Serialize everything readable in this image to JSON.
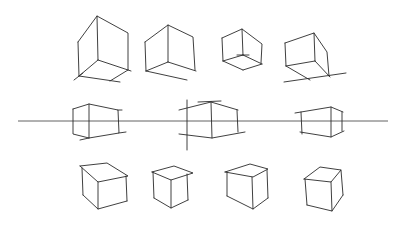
{
  "drawing": {
    "background": "#ffffff",
    "ink": "#2a2a2a",
    "description": "Hand-drawn perspective cube sketches: four cubes above horizon, three cubes on horizon line, four cubes below horizon",
    "horizon": {
      "x1": 18,
      "x2": 388,
      "y": 121
    },
    "rows": [
      {
        "label": "above-horizon",
        "cubes": 4
      },
      {
        "label": "on-horizon",
        "cubes": 3
      },
      {
        "label": "below-horizon",
        "cubes": 4
      }
    ]
  }
}
